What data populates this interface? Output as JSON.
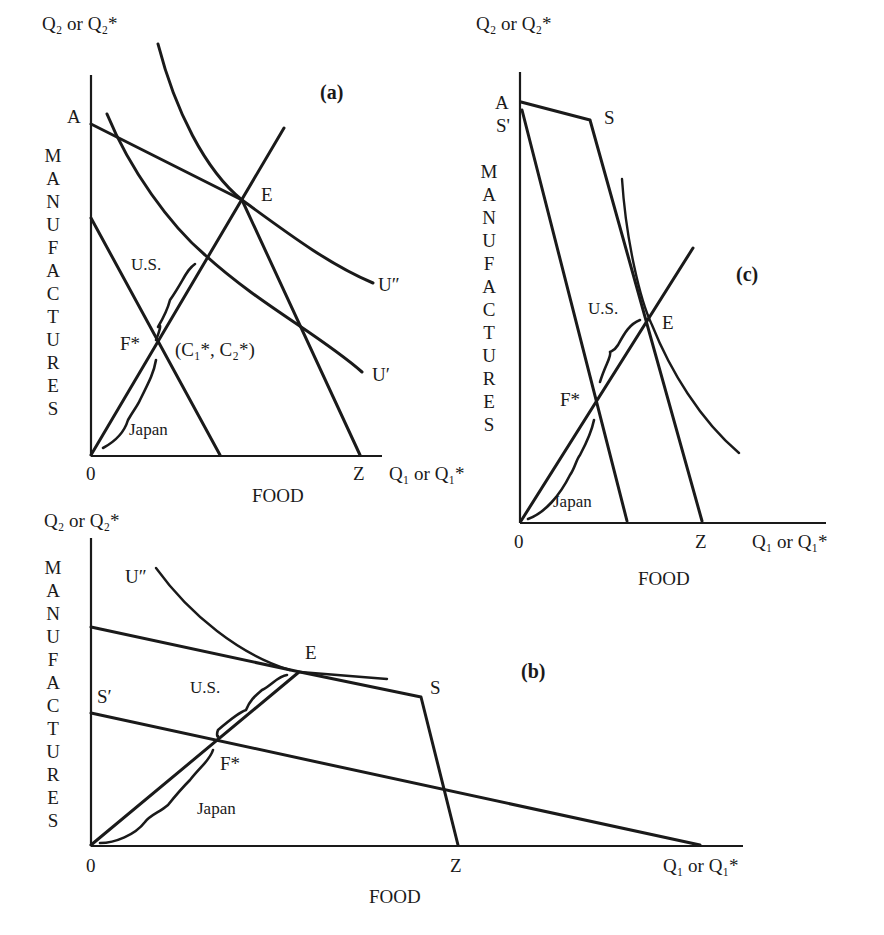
{
  "figure": {
    "panels": [
      {
        "id": "a",
        "tag": "(a)",
        "y_axis_label": "Q₂ or Q₂*",
        "y_axis_title_letters": [
          "M",
          "A",
          "N",
          "U",
          "F",
          "A",
          "C",
          "T",
          "U",
          "R",
          "E",
          "S"
        ],
        "x_axis_label": "Q₁ or Q₁*",
        "x_axis_title": "FOOD",
        "origin_label": "0",
        "labels": {
          "A": "A",
          "E": "E",
          "Z": "Z",
          "F_star": "F*",
          "consumption_point": "(C₁*, C₂*)",
          "U_double_prime": "U″",
          "U_prime": "U′",
          "us": "U.S.",
          "japan": "Japan"
        }
      },
      {
        "id": "b",
        "tag": "(b)",
        "y_axis_label": "Q₂ or Q₂*",
        "y_axis_title_letters": [
          "M",
          "A",
          "N",
          "U",
          "F",
          "A",
          "C",
          "T",
          "U",
          "R",
          "E",
          "S"
        ],
        "x_axis_label": "Q₁ or Q₁*",
        "x_axis_title": "FOOD",
        "origin_label": "0",
        "labels": {
          "E": "E",
          "S": "S",
          "S_prime": "S′",
          "Z": "Z",
          "F_star": "F*",
          "U_double_prime": "U″",
          "us": "U.S.",
          "japan": "Japan"
        }
      },
      {
        "id": "c",
        "tag": "(c)",
        "y_axis_label": "Q₂ or Q₂*",
        "y_axis_title_letters": [
          "M",
          "A",
          "N",
          "U",
          "F",
          "A",
          "C",
          "T",
          "U",
          "R",
          "E",
          "S"
        ],
        "x_axis_label": "Q₁ or Q₁*",
        "x_axis_title": "FOOD",
        "origin_label": "0",
        "labels": {
          "A": "A",
          "S_prime": "S'",
          "S": "S",
          "E": "E",
          "Z": "Z",
          "F_star": "F*",
          "us": "U.S.",
          "japan": "Japan"
        }
      }
    ]
  }
}
